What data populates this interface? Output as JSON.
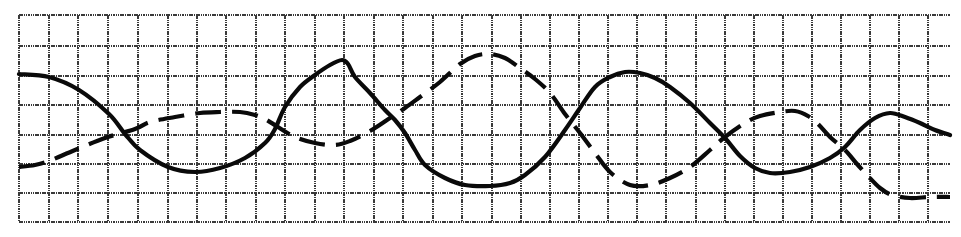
{
  "chart_data": {
    "type": "line",
    "title": "",
    "xlabel": "",
    "ylabel": "",
    "grid": true,
    "legend": null,
    "tick_labels": {
      "x": [],
      "y": []
    },
    "units": "pixel coordinates (image space, y grows downward)",
    "plot_area": {
      "x0": 19,
      "x1": 950,
      "y0": 15,
      "y1": 222
    },
    "grid_lines": {
      "vertical_x": [
        19,
        49,
        78,
        108,
        138,
        168,
        197,
        226,
        256,
        285,
        315,
        344,
        374,
        403,
        433,
        462,
        492,
        521,
        550,
        579,
        608,
        637,
        666,
        696,
        725,
        754,
        783,
        812,
        841,
        870,
        899,
        928
      ],
      "horizontal_y": [
        15,
        46,
        76,
        105,
        135,
        164,
        193,
        222
      ],
      "color": "#3a3a3a"
    },
    "series": [
      {
        "name": "solid-line",
        "style": "solid",
        "color": "#0a0a0a",
        "points": [
          [
            19,
            74
          ],
          [
            49,
            77
          ],
          [
            79,
            90
          ],
          [
            109,
            114
          ],
          [
            125,
            134
          ],
          [
            140,
            150
          ],
          [
            168,
            167
          ],
          [
            195,
            172
          ],
          [
            220,
            168
          ],
          [
            245,
            158
          ],
          [
            265,
            143
          ],
          [
            275,
            129
          ],
          [
            285,
            107
          ],
          [
            300,
            87
          ],
          [
            315,
            75
          ],
          [
            330,
            65
          ],
          [
            342,
            60
          ],
          [
            348,
            64
          ],
          [
            355,
            77
          ],
          [
            370,
            93
          ],
          [
            385,
            110
          ],
          [
            395,
            120
          ],
          [
            405,
            133
          ],
          [
            415,
            150
          ],
          [
            425,
            165
          ],
          [
            445,
            178
          ],
          [
            465,
            185
          ],
          [
            490,
            186
          ],
          [
            510,
            183
          ],
          [
            525,
            175
          ],
          [
            545,
            157
          ],
          [
            565,
            130
          ],
          [
            580,
            108
          ],
          [
            595,
            87
          ],
          [
            610,
            77
          ],
          [
            625,
            72
          ],
          [
            640,
            73
          ],
          [
            655,
            78
          ],
          [
            670,
            87
          ],
          [
            690,
            103
          ],
          [
            710,
            123
          ],
          [
            725,
            138
          ],
          [
            740,
            156
          ],
          [
            755,
            168
          ],
          [
            770,
            173
          ],
          [
            790,
            172
          ],
          [
            810,
            167
          ],
          [
            830,
            158
          ],
          [
            845,
            147
          ],
          [
            860,
            130
          ],
          [
            875,
            118
          ],
          [
            890,
            113
          ],
          [
            905,
            117
          ],
          [
            920,
            123
          ],
          [
            935,
            130
          ],
          [
            950,
            135
          ]
        ]
      },
      {
        "name": "dashed-line",
        "style": "dashed",
        "color": "#0a0a0a",
        "points": [
          [
            19,
            167
          ],
          [
            35,
            165
          ],
          [
            49,
            161
          ],
          [
            75,
            150
          ],
          [
            105,
            138
          ],
          [
            135,
            129
          ],
          [
            150,
            122
          ],
          [
            175,
            117
          ],
          [
            200,
            113
          ],
          [
            220,
            112
          ],
          [
            240,
            112
          ],
          [
            255,
            115
          ],
          [
            265,
            119
          ],
          [
            278,
            127
          ],
          [
            295,
            137
          ],
          [
            315,
            143
          ],
          [
            335,
            145
          ],
          [
            350,
            141
          ],
          [
            370,
            131
          ],
          [
            390,
            118
          ],
          [
            405,
            108
          ],
          [
            420,
            97
          ],
          [
            440,
            82
          ],
          [
            460,
            64
          ],
          [
            475,
            56
          ],
          [
            490,
            54
          ],
          [
            505,
            58
          ],
          [
            520,
            68
          ],
          [
            535,
            79
          ],
          [
            550,
            93
          ],
          [
            565,
            114
          ],
          [
            580,
            133
          ],
          [
            595,
            153
          ],
          [
            610,
            172
          ],
          [
            630,
            185
          ],
          [
            650,
            185
          ],
          [
            670,
            178
          ],
          [
            690,
            167
          ],
          [
            710,
            150
          ],
          [
            725,
            137
          ],
          [
            745,
            123
          ],
          [
            760,
            116
          ],
          [
            780,
            112
          ],
          [
            795,
            111
          ],
          [
            808,
            116
          ],
          [
            818,
            124
          ],
          [
            830,
            137
          ],
          [
            845,
            150
          ],
          [
            857,
            164
          ],
          [
            868,
            176
          ],
          [
            880,
            188
          ],
          [
            892,
            195
          ],
          [
            910,
            198
          ],
          [
            930,
            197
          ],
          [
            950,
            197
          ]
        ]
      }
    ]
  }
}
